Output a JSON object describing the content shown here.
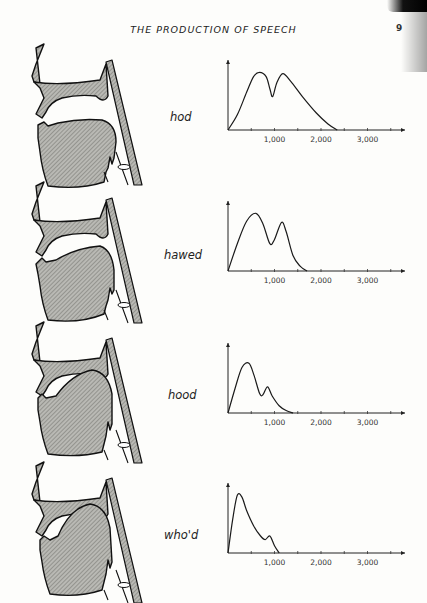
{
  "page": {
    "header": "THE PRODUCTION OF SPEECH",
    "page_number": "9"
  },
  "figures": [
    {
      "word": "hod",
      "tract": "open-back"
    },
    {
      "word": "hawed",
      "tract": "mid-back"
    },
    {
      "word": "hood",
      "tract": "close-mid-back"
    },
    {
      "word": "who'd",
      "tract": "close-back"
    }
  ],
  "axis": {
    "tick_labels": [
      "1,000",
      "2,000",
      "3,000"
    ]
  },
  "chart_data": [
    {
      "type": "line",
      "title": "hod",
      "xlabel": "Frequency (Hz)",
      "ylabel": "Relative amplitude",
      "x_ticks": [
        500,
        1000,
        1500,
        2000,
        2500,
        3000,
        3500
      ],
      "x_tick_labels": [
        "1,000",
        "2,000",
        "3,000"
      ],
      "xlim": [
        0,
        3800
      ],
      "ylim": [
        0,
        1
      ],
      "grid": false,
      "x": [
        0,
        200,
        400,
        550,
        680,
        820,
        900,
        960,
        1050,
        1180,
        1350,
        1600,
        1900,
        2150,
        2350
      ],
      "values": [
        0,
        0.25,
        0.62,
        0.88,
        0.95,
        0.88,
        0.68,
        0.55,
        0.78,
        0.93,
        0.8,
        0.55,
        0.28,
        0.1,
        0
      ]
    },
    {
      "type": "line",
      "title": "hawed",
      "xlabel": "Frequency (Hz)",
      "ylabel": "Relative amplitude",
      "x_ticks": [
        500,
        1000,
        1500,
        2000,
        2500,
        3000,
        3500
      ],
      "x_tick_labels": [
        "1,000",
        "2,000",
        "3,000"
      ],
      "xlim": [
        0,
        3800
      ],
      "ylim": [
        0,
        1
      ],
      "grid": false,
      "x": [
        0,
        200,
        400,
        600,
        750,
        900,
        1000,
        1150,
        1250,
        1400,
        1550,
        1700
      ],
      "values": [
        0,
        0.45,
        0.82,
        0.95,
        0.78,
        0.45,
        0.52,
        0.8,
        0.65,
        0.25,
        0.08,
        0
      ]
    },
    {
      "type": "line",
      "title": "hood",
      "xlabel": "Frequency (Hz)",
      "ylabel": "Relative amplitude",
      "x_ticks": [
        500,
        1000,
        1500,
        2000,
        2500,
        3000,
        3500
      ],
      "x_tick_labels": [
        "1,000",
        "2,000",
        "3,000"
      ],
      "xlim": [
        0,
        3800
      ],
      "ylim": [
        0,
        1
      ],
      "grid": false,
      "x": [
        0,
        150,
        300,
        450,
        560,
        680,
        750,
        850,
        950,
        1100,
        1250,
        1400
      ],
      "values": [
        0,
        0.4,
        0.75,
        0.82,
        0.62,
        0.32,
        0.3,
        0.43,
        0.28,
        0.12,
        0.04,
        0
      ]
    },
    {
      "type": "line",
      "title": "who'd",
      "xlabel": "Frequency (Hz)",
      "ylabel": "Relative amplitude",
      "x_ticks": [
        500,
        1000,
        1500,
        2000,
        2500,
        3000,
        3500
      ],
      "x_tick_labels": [
        "1,000",
        "2,000",
        "3,000"
      ],
      "xlim": [
        0,
        3800
      ],
      "ylim": [
        0,
        1
      ],
      "grid": false,
      "x": [
        0,
        100,
        200,
        300,
        400,
        550,
        700,
        800,
        900,
        1000,
        1100
      ],
      "values": [
        0,
        0.55,
        0.95,
        0.92,
        0.7,
        0.45,
        0.28,
        0.22,
        0.28,
        0.12,
        0
      ]
    }
  ]
}
